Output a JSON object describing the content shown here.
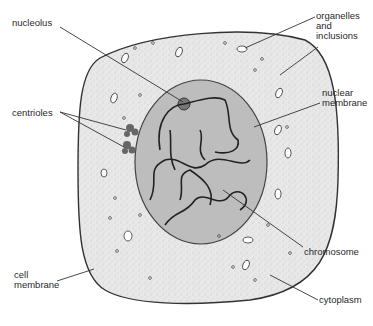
{
  "diagram": {
    "colors": {
      "cytoplasm": "#e6e6e6",
      "nucleus": "#bdbdbd",
      "outline": "#333333",
      "label": "#2a2a2a"
    },
    "labels": {
      "nucleolus": "nucleolus",
      "centrioles": "centrioles",
      "organelles": "organelles\nand\ninclusions",
      "nuclear_membrane": "nuclear\nmembrane",
      "chromosome": "chromosome",
      "cell_membrane": "cell\nmembrane",
      "cytoplasm": "cytoplasm"
    }
  }
}
